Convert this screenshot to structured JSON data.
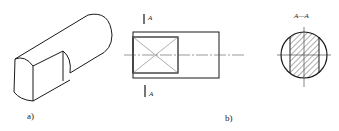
{
  "figure": {
    "panel_a": {
      "label": "a)",
      "description": "isometric view of cylindrical shaft with flat milled end"
    },
    "panel_b": {
      "label": "b)",
      "section_mark_top": "A",
      "section_mark_bottom": "A",
      "description": "front view with flat region marked by diagonal cross"
    },
    "panel_c": {
      "title": "A—A",
      "description": "cross-section showing hatched flat-sided circle"
    }
  },
  "colors": {
    "line": "#1a1a1a",
    "thin": "#555555",
    "background": "#ffffff"
  }
}
